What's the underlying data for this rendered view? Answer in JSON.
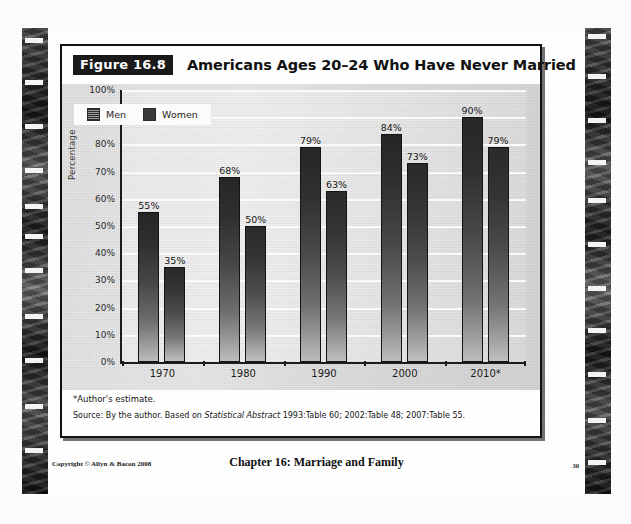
{
  "figure": {
    "badge": "Figure 16.8",
    "title": "Americans Ages 20–24 Who Have Never Married",
    "footnote": "*Author's estimate.",
    "source_prefix": "Source: By the author. Based on ",
    "source_italic": "Statistical Abstract",
    "source_suffix": " 1993:Table 60; 2002:Table 48; 2007:Table 55."
  },
  "footer": {
    "copyright": "Copyright © Allyn & Bacon 2008",
    "chapter": "Chapter 16: Marriage and Family",
    "page_number": "30"
  },
  "chart_data": {
    "type": "bar",
    "title": "Americans Ages 20–24 Who Have Never Married",
    "xlabel": "",
    "ylabel": "Percentage",
    "ylim": [
      0,
      100
    ],
    "ytick_labels": [
      "100%",
      "90%",
      "80%",
      "70%",
      "60%",
      "50%",
      "40%",
      "30%",
      "20%",
      "10%",
      "0%"
    ],
    "ytick_values": [
      100,
      90,
      80,
      70,
      60,
      50,
      40,
      30,
      20,
      10,
      0
    ],
    "categories": [
      "1970",
      "1980",
      "1990",
      "2000",
      "2010*"
    ],
    "grid": true,
    "legend_position": "top-left",
    "series": [
      {
        "name": "Men",
        "values": [
          55,
          68,
          79,
          84,
          90
        ],
        "labels": [
          "55%",
          "68%",
          "79%",
          "84%",
          "90%"
        ],
        "color": "#2e2e2e"
      },
      {
        "name": "Women",
        "values": [
          35,
          50,
          63,
          73,
          79
        ],
        "labels": [
          "35%",
          "50%",
          "63%",
          "73%",
          "79%"
        ],
        "color": "#3a3a3a"
      }
    ]
  }
}
